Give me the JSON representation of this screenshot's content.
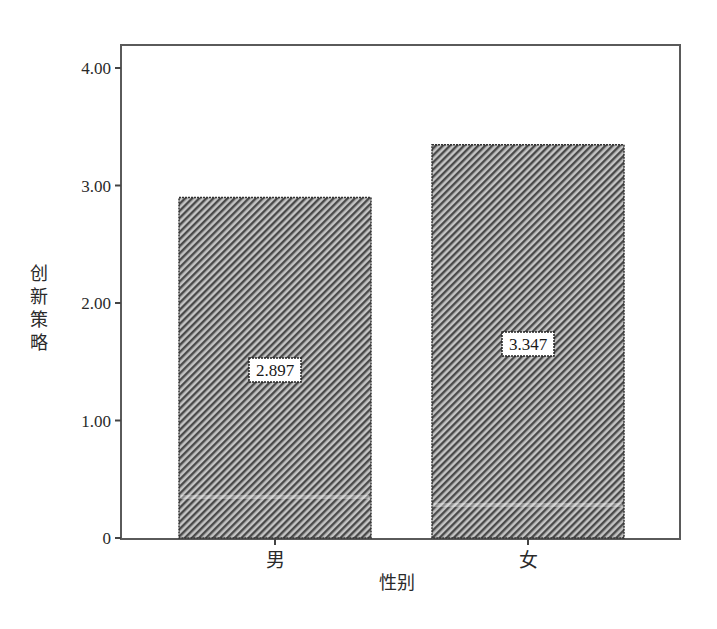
{
  "chart_data": {
    "type": "bar",
    "title": "",
    "xlabel": "性别",
    "ylabel": "创新策略",
    "categories": [
      "男",
      "女"
    ],
    "values": [
      2.897,
      3.347
    ],
    "data_labels": [
      "2.897",
      "3.347"
    ],
    "ylim": [
      0,
      4.2
    ],
    "yticks": [
      0,
      1.0,
      2.0,
      3.0,
      4.0
    ],
    "ytick_labels": [
      "0",
      "1.00",
      "2.00",
      "3.00",
      "4.00"
    ],
    "grid": false,
    "legend": null,
    "bar_fill": "diagonal-hatch",
    "colors": {
      "hatch_dark": "#4a4a4a",
      "hatch_light": "#bdbdbd",
      "frame": "#555555"
    }
  }
}
